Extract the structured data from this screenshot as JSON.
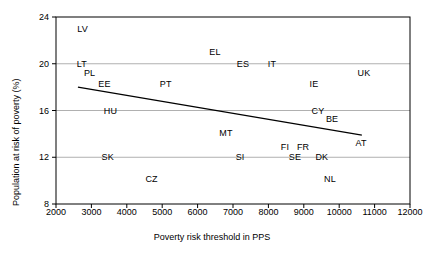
{
  "chart_data": {
    "type": "scatter",
    "title": "",
    "xlabel": "Poverty risk threshold in PPS",
    "ylabel": "Population at risk of poverty (%)",
    "xlim": [
      2000,
      12000
    ],
    "ylim": [
      8,
      24
    ],
    "xticks": [
      2000,
      3000,
      4000,
      5000,
      6000,
      7000,
      8000,
      9000,
      10000,
      11000,
      12000
    ],
    "yticks": [
      8,
      12,
      16,
      20,
      24
    ],
    "grid": "horizontal",
    "legend": "none",
    "marker_style": "text-label-only",
    "points": [
      {
        "label": "LV",
        "x": 2750,
        "y": 23.0
      },
      {
        "label": "LT",
        "x": 2730,
        "y": 20.0
      },
      {
        "label": "PL",
        "x": 2950,
        "y": 19.2
      },
      {
        "label": "EE",
        "x": 3370,
        "y": 18.3
      },
      {
        "label": "HU",
        "x": 3540,
        "y": 16.0
      },
      {
        "label": "SK",
        "x": 3460,
        "y": 12.0
      },
      {
        "label": "CZ",
        "x": 4700,
        "y": 10.1
      },
      {
        "label": "PT",
        "x": 5100,
        "y": 18.3
      },
      {
        "label": "EL",
        "x": 6490,
        "y": 21.0
      },
      {
        "label": "MT",
        "x": 6800,
        "y": 14.1
      },
      {
        "label": "SI",
        "x": 7200,
        "y": 12.0
      },
      {
        "label": "ES",
        "x": 7280,
        "y": 20.0
      },
      {
        "label": "IT",
        "x": 8100,
        "y": 20.0
      },
      {
        "label": "FI",
        "x": 8470,
        "y": 12.9
      },
      {
        "label": "FR",
        "x": 8980,
        "y": 12.9
      },
      {
        "label": "SE",
        "x": 8750,
        "y": 12.0
      },
      {
        "label": "DK",
        "x": 9510,
        "y": 12.0
      },
      {
        "label": "IE",
        "x": 9290,
        "y": 18.3
      },
      {
        "label": "CY",
        "x": 9400,
        "y": 16.0
      },
      {
        "label": "BE",
        "x": 9800,
        "y": 15.3
      },
      {
        "label": "NL",
        "x": 9740,
        "y": 10.1
      },
      {
        "label": "AT",
        "x": 10620,
        "y": 13.2
      },
      {
        "label": "UK",
        "x": 10700,
        "y": 19.2
      }
    ],
    "trendline": {
      "x_start": 2620,
      "y_start": 18.0,
      "x_end": 10640,
      "y_end": 13.9,
      "color": "#000000"
    },
    "colors": {
      "axis": "#000000",
      "grid": "#b0b0b0",
      "text": "#000000"
    }
  }
}
